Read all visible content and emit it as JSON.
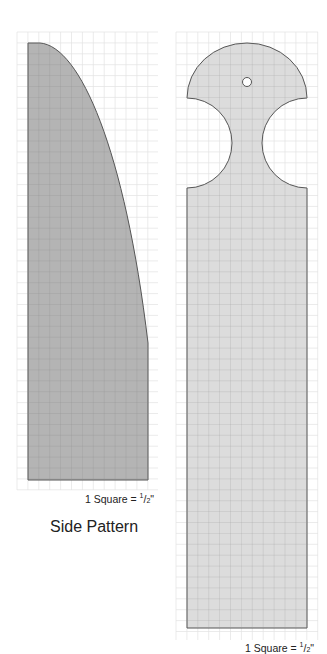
{
  "side_pattern": {
    "title": "Side Pattern",
    "scale_label_prefix": "1 Square = ",
    "scale_numerator": "1",
    "scale_denominator": "2",
    "scale_unit": "\"",
    "fill_color": "#b4b4b4",
    "outline_color": "#555555"
  },
  "back_pattern": {
    "scale_label_prefix": "1 Square = ",
    "scale_numerator": "1",
    "scale_denominator": "2",
    "scale_unit": "\"",
    "fill_color": "#dcdcdc",
    "outline_color": "#555555",
    "features": [
      "rounded-top",
      "hanging-hole",
      "semicircle-cutouts"
    ]
  },
  "grid": {
    "line_color": "#e2e2e2"
  }
}
